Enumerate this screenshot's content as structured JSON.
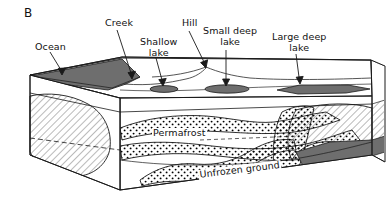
{
  "figure": {
    "panel_letter": "B",
    "type": "geologic-block-diagram",
    "background_color": "#ffffff",
    "line_color": "#1a1a1a",
    "water_fill_color": "#6e6e6e",
    "hatch_color": "#333333",
    "stipple_color": "#000000"
  },
  "callouts": [
    {
      "name": "ocean",
      "label": "Ocean",
      "label_x": 35,
      "label_y": 42,
      "tip_x": 62,
      "tip_y": 74,
      "arrow": true
    },
    {
      "name": "creek",
      "label": "Creek",
      "label_x": 107,
      "label_y": 18,
      "tip_x": 132,
      "tip_y": 77,
      "arrow": true
    },
    {
      "name": "shallow-lake",
      "label": "Shallow\nlake",
      "label_x": 143,
      "label_y": 38,
      "tip_x": 163,
      "tip_y": 85,
      "arrow": true
    },
    {
      "name": "hill",
      "label": "Hill",
      "label_x": 184,
      "label_y": 18,
      "tip_x": 205,
      "tip_y": 67,
      "arrow": true
    },
    {
      "name": "small-deep-lake",
      "label": "Small deep\nlake",
      "label_x": 206,
      "label_y": 28,
      "tip_x": 226,
      "tip_y": 85,
      "arrow": true
    },
    {
      "name": "large-deep-lake",
      "label": "Large deep\nlake",
      "label_x": 273,
      "label_y": 33,
      "tip_x": 299,
      "tip_y": 83,
      "arrow": true
    }
  ],
  "interior_labels": [
    {
      "name": "permafrost",
      "text": "Permafrost",
      "x": 155,
      "y": 134,
      "rotation": 0,
      "font_size": 9.5
    },
    {
      "name": "unfrozen-ground",
      "text": "Unfrozen ground",
      "x": 232,
      "y": 178,
      "rotation": -7,
      "font_size": 9.5
    }
  ],
  "surface_features": [
    {
      "name": "ocean-wedge",
      "kind": "water-body",
      "fill": "#6e6e6e"
    },
    {
      "name": "shallow-lake-lens",
      "kind": "water-body",
      "fill": "#6e6e6e"
    },
    {
      "name": "small-deep-lake-lens",
      "kind": "water-body",
      "fill": "#6e6e6e"
    },
    {
      "name": "large-deep-lake-lens",
      "kind": "water-body",
      "fill": "#6e6e6e"
    },
    {
      "name": "hill-profile",
      "kind": "topography",
      "fill": "none"
    },
    {
      "name": "creek-channel",
      "kind": "topography",
      "fill": "none"
    }
  ],
  "subsurface_zones": [
    {
      "name": "sub-sea-talik",
      "texture": "diagonal-hatch",
      "side": "left"
    },
    {
      "name": "sub-lake-talik-right",
      "texture": "diagonal-hatch",
      "side": "right"
    },
    {
      "name": "unfrozen-band-upper",
      "texture": "stipple",
      "side": "center"
    },
    {
      "name": "unfrozen-band-lower",
      "texture": "stipple",
      "side": "center"
    },
    {
      "name": "unfrozen-band-front",
      "texture": "stipple",
      "side": "front"
    },
    {
      "name": "permafrost-body",
      "texture": "plain",
      "side": "all"
    }
  ]
}
